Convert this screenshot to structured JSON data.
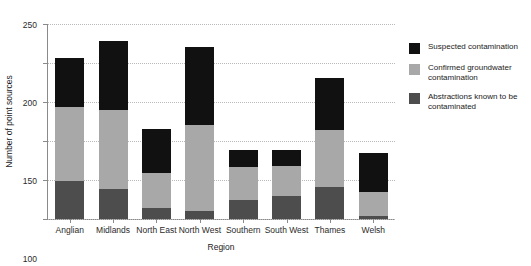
{
  "chart_data": {
    "type": "bar",
    "subtype": "stacked-vertical",
    "title": "",
    "xlabel": "Region",
    "ylabel": "Number of point sources",
    "ylim": [
      0,
      250
    ],
    "yticks": [
      0,
      50,
      100,
      150,
      200,
      250
    ],
    "grid": "horizontal-dotted",
    "legend_position": "right",
    "stack_order_bottom_to_top": [
      "Abstractions known to be contaminated",
      "Confirmed groundwater contamination",
      "Suspected contamination"
    ],
    "categories": [
      "Anglian",
      "Midlands",
      "North East",
      "North West",
      "Southern",
      "South West",
      "Thames",
      "Welsh"
    ],
    "series": [
      {
        "name": "Abstractions known to be contaminated",
        "color": "#4d4d4d",
        "values": [
          49,
          39,
          14,
          10,
          24,
          30,
          41,
          4
        ]
      },
      {
        "name": "Confirmed groundwater contamination",
        "color": "#a8a8a8",
        "values": [
          95,
          101,
          45,
          111,
          43,
          38,
          73,
          31
        ]
      },
      {
        "name": "Suspected contamination",
        "color": "#111111",
        "values": [
          62,
          88,
          56,
          99,
          21,
          20,
          67,
          50
        ]
      }
    ],
    "totals": [
      206,
      228,
      115,
      220,
      88,
      88,
      181,
      85
    ]
  },
  "axes": {
    "y_title": "Number of point sources",
    "x_title": "Region",
    "y_tick_labels": [
      "0",
      "50",
      "100",
      "150",
      "200",
      "250"
    ],
    "x_tick_labels": [
      "Anglian",
      "Midlands",
      "North East",
      "North West",
      "Southern",
      "South West",
      "Thames",
      "Welsh"
    ]
  },
  "legend": {
    "items": [
      {
        "label": "Suspected contamination",
        "color": "#111111",
        "swatch_name": "legend-swatch-suspected"
      },
      {
        "label": "Confirmed groundwater contamination",
        "color": "#a8a8a8",
        "swatch_name": "legend-swatch-confirmed"
      },
      {
        "label": "Abstractions known to be contaminated",
        "color": "#4d4d4d",
        "swatch_name": "legend-swatch-abstractions"
      }
    ]
  },
  "colors": {
    "suspected": "#111111",
    "confirmed": "#a8a8a8",
    "abstractions": "#4d4d4d",
    "axis": "#8a8a8a",
    "grid": "#b9b9b9",
    "background": "#ffffff"
  }
}
